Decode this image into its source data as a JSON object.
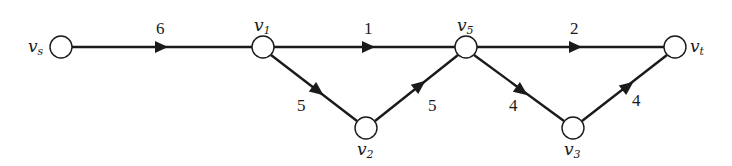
{
  "diagram": {
    "type": "directed-network",
    "nodes": [
      {
        "id": "vs",
        "label": "v",
        "sub": "s",
        "x": 61,
        "y": 47,
        "label_pos": "left"
      },
      {
        "id": "v1",
        "label": "v",
        "sub": "1",
        "x": 263,
        "y": 47,
        "label_pos": "top"
      },
      {
        "id": "v5",
        "label": "v",
        "sub": "5",
        "x": 466,
        "y": 47,
        "label_pos": "top"
      },
      {
        "id": "vt",
        "label": "v",
        "sub": "t",
        "x": 675,
        "y": 47,
        "label_pos": "right"
      },
      {
        "id": "v2",
        "label": "v",
        "sub": "2",
        "x": 366,
        "y": 128,
        "label_pos": "bottom"
      },
      {
        "id": "v3",
        "label": "v",
        "sub": "3",
        "x": 573,
        "y": 128,
        "label_pos": "bottom"
      }
    ],
    "edges": [
      {
        "from": "vs",
        "to": "v1",
        "weight": "6"
      },
      {
        "from": "v1",
        "to": "v5",
        "weight": "1"
      },
      {
        "from": "v5",
        "to": "vt",
        "weight": "2"
      },
      {
        "from": "v1",
        "to": "v2",
        "weight": "5"
      },
      {
        "from": "v2",
        "to": "v5",
        "weight": "5"
      },
      {
        "from": "v5",
        "to": "v3",
        "weight": "4"
      },
      {
        "from": "v3",
        "to": "vt",
        "weight": "4"
      }
    ]
  }
}
